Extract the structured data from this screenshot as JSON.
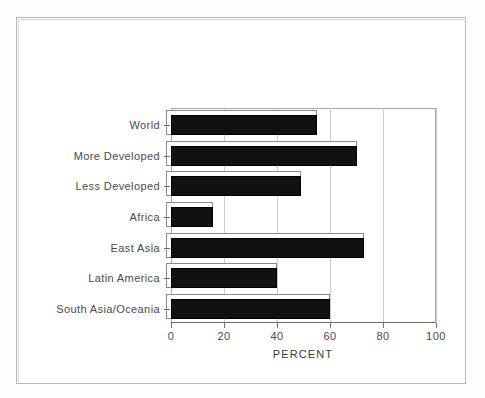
{
  "figure": {
    "frame_color": "#b9b9b9",
    "background": "#ffffff"
  },
  "chart_data": {
    "type": "bar",
    "orientation": "horizontal",
    "style": "3d-shadow-bars",
    "title": "",
    "subtitle": "",
    "xlabel": "PERCENT",
    "ylabel": "",
    "xlim": [
      0,
      100
    ],
    "xticks": [
      0,
      20,
      40,
      60,
      80,
      100
    ],
    "xticklabels": [
      "0",
      "20",
      "40",
      "60",
      "80",
      "100"
    ],
    "grid": "vertical",
    "legend": "none",
    "bar_color": "#111111",
    "categories": [
      "World",
      "More Developed",
      "Less Developed",
      "Africa",
      "East Asia",
      "Latin America",
      "South Asia/Oceania"
    ],
    "values": [
      55,
      70,
      49,
      16,
      73,
      40,
      60
    ]
  }
}
